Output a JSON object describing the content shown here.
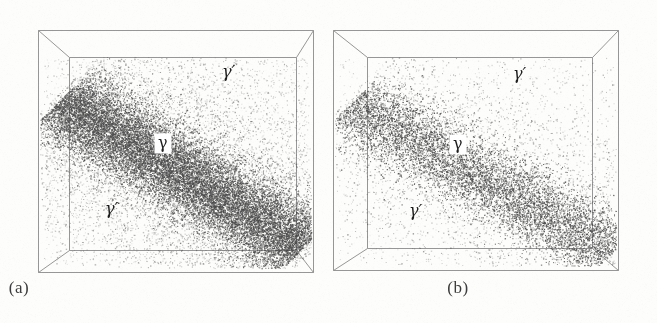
{
  "figure": {
    "kind": "atom-probe-tomography-3d-box-pair",
    "background_color": "#fdfdfb",
    "point_color": "#4a4a4a",
    "box_line_color": "#8a8a8a"
  },
  "panels": [
    {
      "id": "a",
      "caption": "(a)",
      "labels": [
        {
          "name": "gamma-prime-upper-right",
          "text": "γ′",
          "x": 222,
          "y": 75,
          "boxed": false
        },
        {
          "name": "gamma-matrix",
          "text": "γ",
          "x": 160,
          "y": 145,
          "boxed": true
        },
        {
          "name": "gamma-prime-lower-left",
          "text": "γ′",
          "x": 105,
          "y": 212,
          "boxed": false
        }
      ],
      "box": {
        "outer": {
          "x1": 38,
          "y1": 30,
          "x2": 313,
          "y2": 272
        },
        "inner": {
          "x1": 69,
          "y1": 57,
          "x2": 296,
          "y2": 250
        }
      }
    },
    {
      "id": "b",
      "caption": "(b)",
      "labels": [
        {
          "name": "gamma-prime-upper-right",
          "text": "γ′",
          "x": 513,
          "y": 77,
          "boxed": false
        },
        {
          "name": "gamma-matrix",
          "text": "γ",
          "x": 455,
          "y": 146,
          "boxed": true
        },
        {
          "name": "gamma-prime-lower-left",
          "text": "γ′",
          "x": 409,
          "y": 214,
          "boxed": false
        }
      ],
      "box": {
        "outer": {
          "x1": 333,
          "y1": 30,
          "x2": 618,
          "y2": 270
        },
        "inner": {
          "x1": 367,
          "y1": 57,
          "x2": 592,
          "y2": 248
        }
      }
    }
  ],
  "chart_data": {
    "type": "scatter",
    "title": "",
    "xlabel": "",
    "ylabel": "",
    "grid": false,
    "legend_position": "none",
    "series": [
      {
        "name": "panel-a-points",
        "panel": "a",
        "n_points": 26000,
        "density": "high",
        "band": {
          "start": [
            0.06,
            0.2
          ],
          "end": [
            0.98,
            0.92
          ],
          "half_width": 0.3,
          "core_half_width": 0.16
        }
      },
      {
        "name": "panel-b-points",
        "panel": "b",
        "n_points": 12000,
        "density": "low",
        "band": {
          "start": [
            0.04,
            0.22
          ],
          "end": [
            1.0,
            0.95
          ],
          "half_width": 0.3,
          "core_half_width": 0.15
        }
      }
    ]
  }
}
